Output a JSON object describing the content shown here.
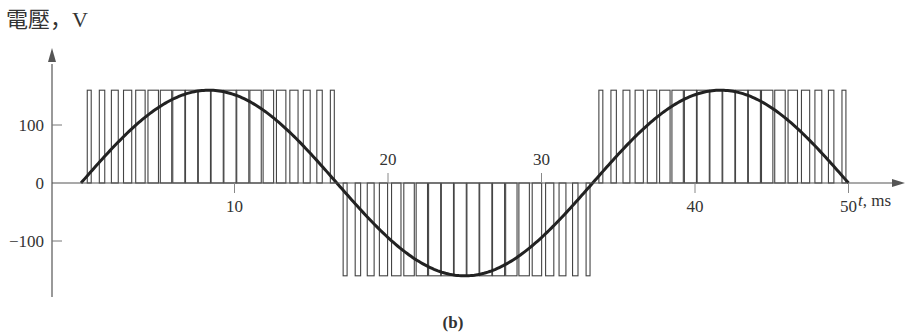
{
  "chart_data": {
    "type": "line",
    "title": "",
    "ylabel": "電壓，V",
    "xlabel_var": "t",
    "xlabel_unit": ", ms",
    "caption": "(b)",
    "xlim": [
      0,
      50
    ],
    "ylim": [
      -170,
      170
    ],
    "x_ticks": [
      {
        "value": 10,
        "label": "10",
        "side": "below"
      },
      {
        "value": 20,
        "label": "20",
        "side": "above"
      },
      {
        "value": 30,
        "label": "30",
        "side": "above"
      },
      {
        "value": 40,
        "label": "40",
        "side": "below"
      },
      {
        "value": 50,
        "label": "50",
        "side": "below"
      }
    ],
    "y_ticks": [
      {
        "value": 100,
        "label": "100"
      },
      {
        "value": 0,
        "label": "0"
      },
      {
        "value": -100,
        "label": "−100"
      }
    ],
    "series": [
      {
        "name": "fundamental sine",
        "kind": "sine",
        "amplitude": 160,
        "frequency_hz": 30,
        "t_start": 0,
        "t_end": 50,
        "color": "#222222"
      },
      {
        "name": "PWM pulses",
        "kind": "pwm",
        "level": 160,
        "pulses_per_half_cycle": 20,
        "half_cycles": [
          {
            "t_start": 0,
            "t_end": 16.67,
            "polarity": 1
          },
          {
            "t_start": 16.67,
            "t_end": 33.33,
            "polarity": -1
          },
          {
            "t_start": 33.33,
            "t_end": 50,
            "polarity": 1
          }
        ],
        "color": "#444444"
      }
    ],
    "grid": false,
    "legend": "none"
  }
}
